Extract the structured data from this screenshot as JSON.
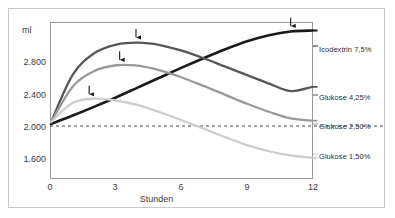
{
  "chart_data": {
    "type": "line",
    "title": "",
    "xlabel": "Stunden",
    "ylabel": "ml",
    "unit_label": "ml",
    "xlim": [
      0,
      12
    ],
    "ylim": [
      1420,
      3080
    ],
    "xticks": [
      0,
      3,
      6,
      9,
      12
    ],
    "xticklabels": [
      "0",
      "3",
      "6",
      "9",
      "12"
    ],
    "yticks": [
      1600,
      2000,
      2400,
      2800
    ],
    "yticklabels": [
      "1.600",
      "2.000",
      "2.400",
      "2.800"
    ],
    "grid": false,
    "legend_position": "right-of-axes",
    "baseline": {
      "value": 2000,
      "style": "dashed",
      "color": "#444444"
    },
    "series": [
      {
        "name": "Icodextrin 7,5%",
        "label": "Icodextrin 7,5%",
        "color": "#1a1a1a",
        "width": 2.6,
        "peak_marker_x": 11.0,
        "x": [
          0,
          1,
          2,
          3,
          4,
          5,
          6,
          7,
          8,
          9,
          10,
          11,
          12
        ],
        "y": [
          2000,
          2090,
          2185,
          2285,
          2390,
          2495,
          2600,
          2700,
          2795,
          2880,
          2945,
          2985,
          2995
        ]
      },
      {
        "name": "Glukose 4,25%",
        "label": "Glukose 4,25%",
        "color": "#575757",
        "width": 2.3,
        "peak_marker_x": 3.9,
        "x": [
          0,
          1,
          2,
          3,
          4,
          5,
          6,
          7,
          8,
          9,
          10,
          11,
          12
        ],
        "y": [
          2020,
          2525,
          2755,
          2845,
          2865,
          2840,
          2780,
          2700,
          2610,
          2520,
          2430,
          2350,
          2395
        ]
      },
      {
        "name": "Glukose 2,50%",
        "label": "Glukose 2,50%",
        "color": "#9a9a9a",
        "width": 2.3,
        "peak_marker_x": 3.15,
        "x": [
          0,
          1,
          2,
          3,
          4,
          5,
          6,
          7,
          8,
          9,
          10,
          11,
          12
        ],
        "y": [
          2020,
          2400,
          2565,
          2625,
          2620,
          2570,
          2495,
          2405,
          2310,
          2215,
          2130,
          2060,
          2035
        ]
      },
      {
        "name": "Glukose 1,50%",
        "label": "Glukose 1,50%",
        "color": "#cdcdcd",
        "width": 2.3,
        "peak_marker_x": 1.75,
        "x": [
          0,
          1,
          2,
          3,
          4,
          5,
          6,
          7,
          8,
          9,
          10,
          11,
          12
        ],
        "y": [
          2020,
          2225,
          2270,
          2250,
          2200,
          2125,
          2040,
          1950,
          1860,
          1775,
          1710,
          1665,
          1640
        ]
      }
    ],
    "annotations": [
      {
        "name": "peak-arrow-glukose-150",
        "series": "Glukose 1,50%",
        "x": 1.75
      },
      {
        "name": "peak-arrow-glukose-250",
        "series": "Glukose 2,50%",
        "x": 3.15
      },
      {
        "name": "peak-arrow-glukose-425",
        "series": "Glukose 4,25%",
        "x": 3.9
      },
      {
        "name": "peak-arrow-icodextrin",
        "series": "Icodextrin 7,5%",
        "x": 11.0
      }
    ]
  },
  "colors": {
    "frame": "#9a9a9a",
    "outer_border": "#c9c9c9",
    "text": "#3a3a3a",
    "arrow": "#1a1a1a",
    "background": "#ffffff"
  }
}
